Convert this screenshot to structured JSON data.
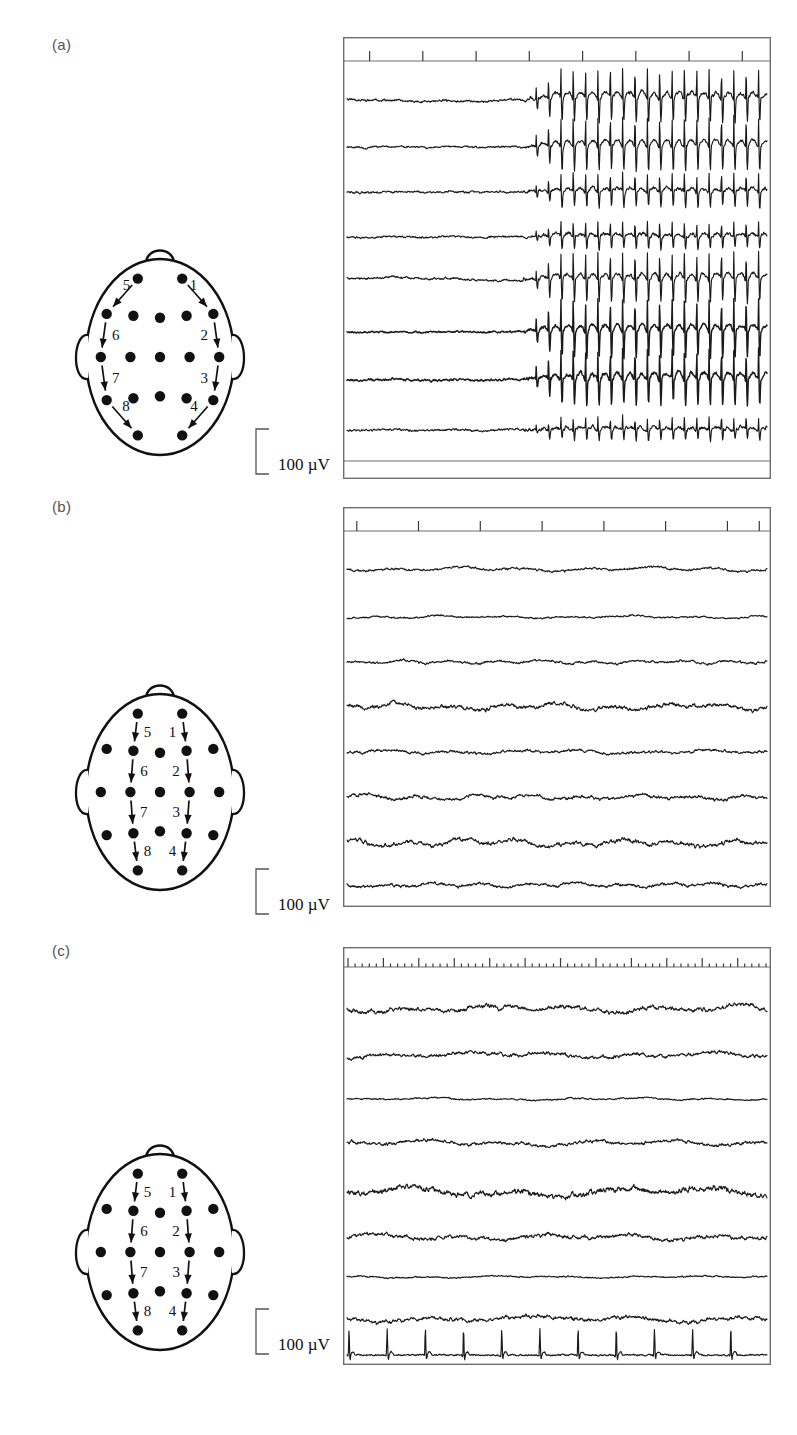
{
  "figure": {
    "panel_labels": [
      "(a)",
      "(b)",
      "(c)"
    ]
  },
  "panels": [
    {
      "id": "a",
      "label": "(a)",
      "scale_label": "100 µV",
      "montage": {
        "name": "double-banana-temporal-chain",
        "arrow_numbers": [
          "1",
          "2",
          "3",
          "4",
          "5",
          "6",
          "7",
          "8"
        ],
        "electrode_count": 19,
        "chain_side_right": [
          "1",
          "2",
          "3",
          "4"
        ],
        "chain_side_left": [
          "5",
          "6",
          "7",
          "8"
        ]
      },
      "traces": {
        "channel_count": 8,
        "pattern": "seizure-onset-with-rhythmic-spike-wave",
        "tick_count": 8,
        "tick_style": "sparse-long"
      }
    },
    {
      "id": "b",
      "label": "(b)",
      "scale_label": "100 µV",
      "montage": {
        "name": "parasagittal-chain",
        "arrow_numbers": [
          "1",
          "2",
          "3",
          "4",
          "5",
          "6",
          "7",
          "8"
        ],
        "electrode_count": 19,
        "chain_side_right": [
          "1",
          "2",
          "3",
          "4"
        ],
        "chain_side_left": [
          "5",
          "6",
          "7",
          "8"
        ]
      },
      "traces": {
        "channel_count": 8,
        "pattern": "normal-background-activity",
        "tick_count": 8,
        "tick_style": "sparse-long"
      }
    },
    {
      "id": "c",
      "label": "(c)",
      "scale_label": "100 µV",
      "montage": {
        "name": "parasagittal-chain",
        "arrow_numbers": [
          "1",
          "2",
          "3",
          "4",
          "5",
          "6",
          "7",
          "8"
        ],
        "electrode_count": 19,
        "chain_side_right": [
          "1",
          "2",
          "3",
          "4"
        ],
        "chain_side_left": [
          "5",
          "6",
          "7",
          "8"
        ]
      },
      "traces": {
        "channel_count": 9,
        "pattern": "slow-wave-activity-with-ecg-channel",
        "tick_count": 60,
        "tick_style": "dense-second-markers",
        "bottom_channel": "ECG"
      }
    }
  ],
  "chart_data": {
    "type": "line",
    "title": "",
    "xlabel": "",
    "ylabel": "",
    "units": "µV",
    "scale_bar": 100,
    "scale_bar_label": "100 µV",
    "panels": [
      {
        "panel": "a",
        "n_channels": 8,
        "x_range": [
          0,
          1
        ],
        "tick_positions": [
          0.06,
          0.185,
          0.31,
          0.435,
          0.56,
          0.685,
          0.81,
          0.935
        ],
        "seizure_onset_x": 0.42,
        "channels": [
          {
            "index": 1,
            "amplitude_pre": 18,
            "amplitude_post": 95,
            "rhythm_hz": 3.0
          },
          {
            "index": 2,
            "amplitude_pre": 14,
            "amplitude_post": 90,
            "rhythm_hz": 3.0
          },
          {
            "index": 3,
            "amplitude_pre": 16,
            "amplitude_post": 55,
            "rhythm_hz": 3.0
          },
          {
            "index": 4,
            "amplitude_pre": 15,
            "amplitude_post": 45,
            "rhythm_hz": 3.0
          },
          {
            "index": 5,
            "amplitude_pre": 17,
            "amplitude_post": 85,
            "rhythm_hz": 3.0
          },
          {
            "index": 6,
            "amplitude_pre": 14,
            "amplitude_post": 100,
            "rhythm_hz": 3.0
          },
          {
            "index": 7,
            "amplitude_pre": 20,
            "amplitude_post": 95,
            "rhythm_hz": 3.0
          },
          {
            "index": 8,
            "amplitude_pre": 18,
            "amplitude_post": 38,
            "rhythm_hz": 3.0
          }
        ]
      },
      {
        "panel": "b",
        "n_channels": 8,
        "x_range": [
          0,
          1
        ],
        "tick_positions": [
          0.03,
          0.175,
          0.32,
          0.465,
          0.61,
          0.755,
          0.9,
          0.975
        ],
        "channels": [
          {
            "index": 1,
            "amplitude": 14,
            "rhythm_hz": 7
          },
          {
            "index": 2,
            "amplitude": 10,
            "rhythm_hz": 7
          },
          {
            "index": 3,
            "amplitude": 14,
            "rhythm_hz": 9
          },
          {
            "index": 4,
            "amplitude": 24,
            "rhythm_hz": 8
          },
          {
            "index": 5,
            "amplitude": 16,
            "rhythm_hz": 7
          },
          {
            "index": 6,
            "amplitude": 20,
            "rhythm_hz": 8
          },
          {
            "index": 7,
            "amplitude": 26,
            "rhythm_hz": 8
          },
          {
            "index": 8,
            "amplitude": 18,
            "rhythm_hz": 9
          }
        ]
      },
      {
        "panel": "c",
        "n_channels": 9,
        "x_range": [
          0,
          1
        ],
        "tick_interval_s": 1,
        "major_tick_every": 5,
        "channels": [
          {
            "index": 1,
            "amplitude": 30,
            "rhythm_hz": 5
          },
          {
            "index": 2,
            "amplitude": 24,
            "rhythm_hz": 5
          },
          {
            "index": 3,
            "amplitude": 10,
            "rhythm_hz": 6
          },
          {
            "index": 4,
            "amplitude": 22,
            "rhythm_hz": 5
          },
          {
            "index": 5,
            "amplitude": 42,
            "rhythm_hz": 4
          },
          {
            "index": 6,
            "amplitude": 28,
            "rhythm_hz": 5
          },
          {
            "index": 7,
            "amplitude": 9,
            "rhythm_hz": 6
          },
          {
            "index": 8,
            "amplitude": 26,
            "rhythm_hz": 4
          },
          {
            "index": 9,
            "amplitude": 55,
            "rhythm_hz": 1.2,
            "type": "ECG"
          }
        ]
      }
    ]
  }
}
